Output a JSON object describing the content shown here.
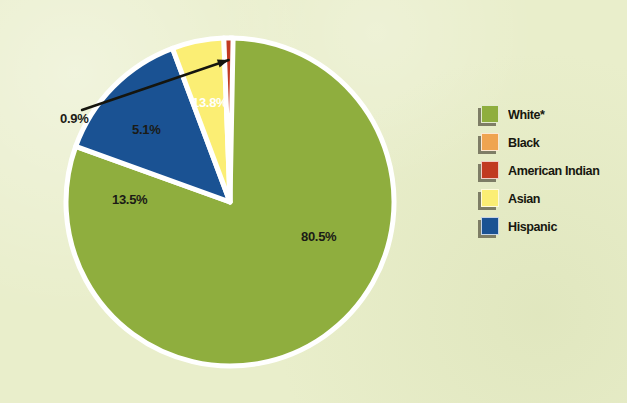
{
  "figure": {
    "background_color": "#e9eecb",
    "pie": {
      "center_x": 230,
      "center_y": 202,
      "radius": 164,
      "outline_color": "#ffffff",
      "outline_width": 5
    }
  },
  "chart_data": {
    "type": "pie",
    "title": "",
    "categories": [
      "White*",
      "Black",
      "American Indian",
      "Asian",
      "Hispanic"
    ],
    "values": [
      80.5,
      13.5,
      0.9,
      5.1,
      13.8
    ],
    "value_labels": [
      "80.5%",
      "13.5%",
      "0.9%",
      "5.1%",
      "13.8%"
    ],
    "colors": [
      "#8fae3e",
      "#efa450",
      "#c13a22",
      "#fbee74",
      "#1a5293"
    ],
    "units": "percent",
    "legend_position": "right",
    "exploded_slices": [
      "Black"
    ],
    "slices": [
      {
        "name": "White*",
        "value": 80.5,
        "label": "80.5%",
        "color": "#8fae3e",
        "start_angle": 0,
        "end_angle": 289.8,
        "exploded": false,
        "label_x": 301,
        "label_y": 229,
        "label_color": "dark"
      },
      {
        "name": "Hispanic",
        "value": 13.8,
        "label": "13.8%",
        "color": "#1a5293",
        "start_angle": 289.8,
        "end_angle": 339.48,
        "exploded": false,
        "label_x": 192,
        "label_y": 95,
        "label_color": "light"
      },
      {
        "name": "Asian",
        "value": 5.1,
        "label": "5.1%",
        "color": "#fbee74",
        "start_angle": 339.48,
        "end_angle": 357.84,
        "exploded": false,
        "label_x": 132,
        "label_y": 122,
        "label_color": "dark"
      },
      {
        "name": "American Indian",
        "value": 0.9,
        "label": "0.9%",
        "color": "#c13a22",
        "start_angle": 357.84,
        "end_angle": 361.08,
        "exploded": false,
        "label_x": 60,
        "label_y": 111,
        "label_color": "dark",
        "has_leader_line": true
      },
      {
        "name": "Black",
        "value": 13.5,
        "label": "13.5%",
        "color": "#efa450",
        "start_angle": 361.08,
        "end_angle": 410.68,
        "exploded": true,
        "label_x": 112,
        "label_y": 192,
        "label_color": "dark"
      }
    ]
  },
  "legend": {
    "items": [
      {
        "label": "White*",
        "color": "#8fae3e"
      },
      {
        "label": "Black",
        "color": "#efa450"
      },
      {
        "label": "American Indian",
        "color": "#c13a22"
      },
      {
        "label": "Asian",
        "color": "#fbee74"
      },
      {
        "label": "Hispanic",
        "color": "#1a5293"
      }
    ]
  }
}
